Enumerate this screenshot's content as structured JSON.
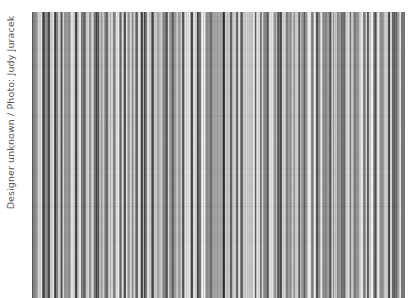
{
  "credit": {
    "text": "Designer unknown / Photo: Judy Juracek"
  },
  "photo": {
    "subject": "vertical-pinstripe-textile",
    "base_color": "#9a9a9a",
    "light_stripe_color": "#e6e6e6",
    "dark_stripe_color": "#4a4a4a"
  }
}
